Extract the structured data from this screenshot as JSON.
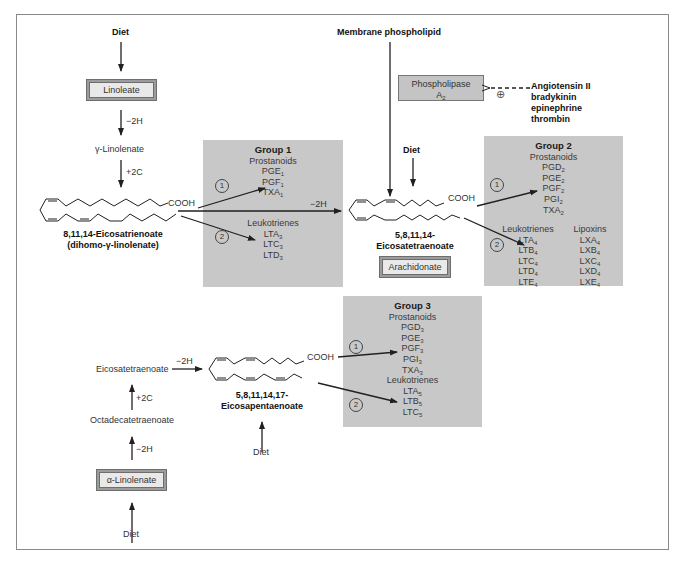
{
  "figure": {
    "top_left": {
      "diet_label": "Diet",
      "linoleate_box": "Linoleate",
      "step1": "−2H",
      "gamma_linolenate": "γ-Linolenate",
      "step2": "+2C",
      "molecule_name_line1": "8,11,14-Eicosatrienoate",
      "molecule_name_line2": "(dihomo-γ-linolenate)",
      "cooh": "COOH",
      "arrow_to_arachidonate": "−2H"
    },
    "center": {
      "membrane_label": "Membrane phospholipid",
      "enzyme_line1": "Phospholipase",
      "enzyme_line2": "A",
      "enzyme_sub": "2",
      "plus_symbol": "⊕",
      "activators": [
        "Angiotensin II",
        "bradykinin",
        "epinephrine",
        "thrombin"
      ],
      "diet_label": "Diet",
      "cooh": "COOH",
      "molecule_name_line1": "5,8,11,14-",
      "molecule_name_line2": "Eicosatetraenoate",
      "arachidonate_box": "Arachidonate"
    },
    "bottom": {
      "eicosatetraenoate": "Eicosatetraenoate",
      "step_to_epa": "−2H",
      "step_plus2c": "+2C",
      "octadecatetraenoate": "Octadecatetraenoate",
      "step_minus2h": "−2H",
      "alpha_linolenate_box": "α-Linolenate",
      "diet_bottom_left": "Diet",
      "cooh": "COOH",
      "molecule_name_line1": "5,8,11,14,17-",
      "molecule_name_line2": "Eicosapentaenoate",
      "diet_epa": "Diet"
    },
    "pathway_markers": {
      "one": "1",
      "two": "2"
    },
    "groups": [
      {
        "title": "Group 1",
        "prostanoids_label": "Prostanoids",
        "prostanoids": [
          {
            "base": "PGE",
            "sub": "1"
          },
          {
            "base": "PGF",
            "sub": "1"
          },
          {
            "base": "TXA",
            "sub": "1"
          }
        ],
        "leukotrienes_label": "Leukotrienes",
        "leukotrienes": [
          {
            "base": "LTA",
            "sub": "3"
          },
          {
            "base": "LTC",
            "sub": "3"
          },
          {
            "base": "LTD",
            "sub": "3"
          }
        ]
      },
      {
        "title": "Group 2",
        "prostanoids_label": "Prostanoids",
        "prostanoids": [
          {
            "base": "PGD",
            "sub": "2"
          },
          {
            "base": "PGE",
            "sub": "2"
          },
          {
            "base": "PGF",
            "sub": "2"
          },
          {
            "base": "PGI",
            "sub": "2"
          },
          {
            "base": "TXA",
            "sub": "2"
          }
        ],
        "leukotrienes_label": "Leukotrienes",
        "leukotrienes": [
          {
            "base": "LTA",
            "sub": "4"
          },
          {
            "base": "LTB",
            "sub": "4"
          },
          {
            "base": "LTC",
            "sub": "4"
          },
          {
            "base": "LTD",
            "sub": "4"
          },
          {
            "base": "LTE",
            "sub": "4"
          }
        ],
        "lipoxins_label": "Lipoxins",
        "lipoxins": [
          {
            "base": "LXA",
            "sub": "4"
          },
          {
            "base": "LXB",
            "sub": "4"
          },
          {
            "base": "LXC",
            "sub": "4"
          },
          {
            "base": "LXD",
            "sub": "4"
          },
          {
            "base": "LXE",
            "sub": "4"
          }
        ]
      },
      {
        "title": "Group 3",
        "prostanoids_label": "Prostanoids",
        "prostanoids": [
          {
            "base": "PGD",
            "sub": "3"
          },
          {
            "base": "PGE",
            "sub": "3"
          },
          {
            "base": "PGF",
            "sub": "3"
          },
          {
            "base": "PGI",
            "sub": "3"
          },
          {
            "base": "TXA",
            "sub": "3"
          }
        ],
        "leukotrienes_label": "Leukotrienes",
        "leukotrienes": [
          {
            "base": "LTA",
            "sub": "5"
          },
          {
            "base": "LTB",
            "sub": "5"
          },
          {
            "base": "LTC",
            "sub": "5"
          }
        ]
      }
    ],
    "colors": {
      "group_fill": "#c8c8c8",
      "box_outer": "#9c9c9c",
      "box_inner": "#e9e9e9",
      "line": "#231f20",
      "frame": "#8a8a8a"
    }
  }
}
